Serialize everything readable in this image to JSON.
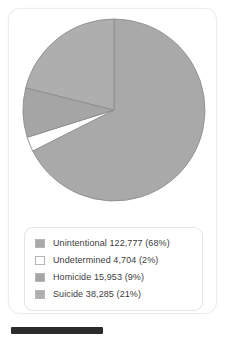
{
  "card": {
    "name": "pie-chart-card"
  },
  "chart_data": {
    "type": "pie",
    "title": "",
    "subtitle": "",
    "xlabel": "",
    "ylabel": "",
    "legend_position": "bottom",
    "grid": false,
    "start_angle_deg": 0,
    "direction": "clockwise",
    "categories": [
      "Unintentional",
      "Undetermined",
      "Homicide",
      "Suicide"
    ],
    "values": [
      122777,
      4704,
      15953,
      38285
    ],
    "percents": [
      68,
      2,
      9,
      21
    ],
    "value_labels": [
      "122,777",
      "4,704",
      "15,953",
      "38,285"
    ],
    "percent_labels": [
      "(68%)",
      "(2%)",
      "(9%)",
      "(21%)"
    ],
    "colors": [
      "#a9a9a9",
      "#ffffff",
      "#a5a5a5",
      "#aeaeae"
    ],
    "slice_border_color": "#8c8c8c",
    "total": 181719
  },
  "legend": {
    "items": [
      {
        "label": "Unintentional 122,777 (68%)",
        "category": "Unintentional",
        "value": "122,777",
        "percent": "(68%)",
        "color": "#a9a9a9"
      },
      {
        "label": "Undetermined 4,704 (2%)",
        "category": "Undetermined",
        "value": "4,704",
        "percent": "(2%)",
        "color": "#ffffff"
      },
      {
        "label": "Homicide 15,953 (9%)",
        "category": "Homicide",
        "value": "15,953",
        "percent": "(9%)",
        "color": "#a5a5a5"
      },
      {
        "label": "Suicide 38,285 (21%)",
        "category": "Suicide",
        "value": "38,285",
        "percent": "(21%)",
        "color": "#aeaeae"
      }
    ]
  },
  "footer": {
    "bar_color": "#2b2b2b"
  }
}
